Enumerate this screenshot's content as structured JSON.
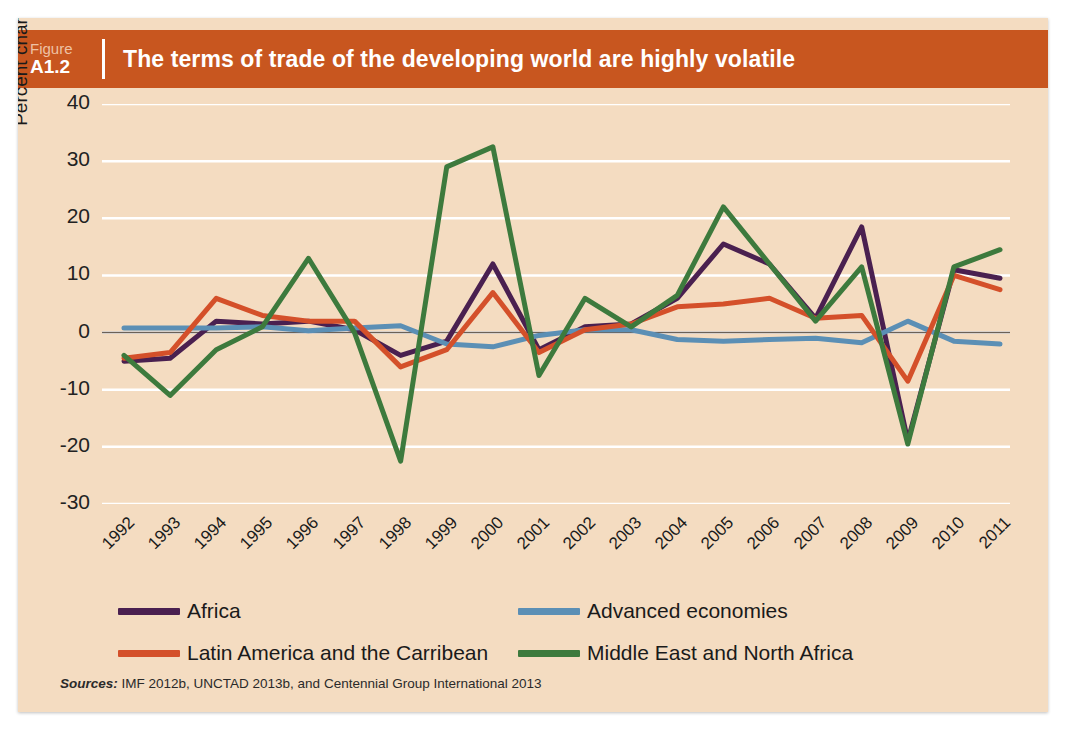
{
  "header": {
    "figure_word": "Figure",
    "figure_id": "A1.2",
    "title": "The terms of trade of the developing world are highly volatile",
    "band_color": "#c8561f"
  },
  "source": {
    "label": "Sources:",
    "text": " IMF 2012b, UNCTAD 2013b, and Centennial Group International 2013"
  },
  "legend": {
    "items": [
      {
        "label": "Africa",
        "color": "#4a2050"
      },
      {
        "label": "Advanced economies",
        "color": "#5b8fb5"
      },
      {
        "label": "Latin America and the Carribean",
        "color": "#d4502a"
      },
      {
        "label": "Middle East and North Africa",
        "color": "#3d7a3d"
      }
    ]
  },
  "chart_data": {
    "type": "line",
    "title": "The terms of trade of the developing world are highly volatile",
    "xlabel": "",
    "ylabel": "Percent change in terms of trade",
    "ylim": [
      -30,
      40
    ],
    "ytick_step": 10,
    "yticks": [
      "40",
      "30",
      "20",
      "10",
      "0",
      "-10",
      "-20",
      "-30"
    ],
    "grid": true,
    "legend_position": "bottom",
    "background_color": "#f4dcc1",
    "gridline_color": "#ffffff",
    "zero_line_color": "#6b6157",
    "categories": [
      "1992",
      "1993",
      "1994",
      "1995",
      "1996",
      "1997",
      "1998",
      "1999",
      "2000",
      "2001",
      "2002",
      "2003",
      "2004",
      "2005",
      "2006",
      "2007",
      "2008",
      "2009",
      "2010",
      "2011"
    ],
    "series": [
      {
        "name": "Africa",
        "color": "#4a2050",
        "values": [
          -5.0,
          -4.5,
          2.0,
          1.5,
          2.0,
          0.5,
          -4.0,
          -1.5,
          12.0,
          -3.0,
          1.0,
          1.5,
          6.0,
          15.5,
          12.0,
          2.5,
          18.5,
          -19.0,
          11.0,
          9.5
        ]
      },
      {
        "name": "Advanced economies",
        "color": "#5b8fb5",
        "values": [
          0.8,
          0.8,
          0.8,
          1.0,
          0.3,
          0.8,
          1.2,
          -2.0,
          -2.5,
          -0.5,
          0.5,
          0.5,
          -1.2,
          -1.5,
          -1.2,
          -1.0,
          -1.8,
          2.0,
          -1.5,
          -2.0
        ]
      },
      {
        "name": "Latin America and the Carribean",
        "color": "#d4502a",
        "values": [
          -4.5,
          -3.5,
          6.0,
          3.0,
          2.0,
          2.0,
          -6.0,
          -3.0,
          7.0,
          -3.5,
          0.5,
          1.5,
          4.5,
          5.0,
          6.0,
          2.5,
          3.0,
          -8.5,
          10.0,
          7.5
        ]
      },
      {
        "name": "Middle East and North Africa",
        "color": "#3d7a3d",
        "values": [
          -4.0,
          -11.0,
          -3.0,
          1.0,
          13.0,
          0.0,
          -22.5,
          29.0,
          32.5,
          -7.5,
          6.0,
          1.0,
          6.5,
          22.0,
          12.0,
          2.0,
          11.5,
          -19.5,
          11.5,
          14.5
        ]
      }
    ]
  }
}
